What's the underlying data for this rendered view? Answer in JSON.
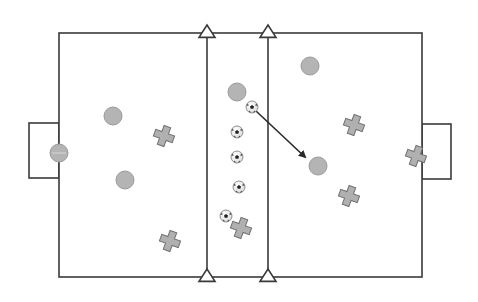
{
  "diagram": {
    "type": "soccer-drill",
    "colors": {
      "line": "#3a3a3a",
      "player_fill": "#b4b4b4",
      "player_stroke": "#9a9a9a",
      "cross_fill": "#b0b0b0",
      "cross_stroke": "#6e6e6e",
      "cone_fill": "#ffffff",
      "arrow": "#2a2a2a"
    },
    "field": {
      "x": 59,
      "y": 33,
      "w": 363,
      "h": 244
    },
    "middle_zone": {
      "x1": 207,
      "x2": 268
    },
    "goals": [
      {
        "side": "left",
        "x": 29,
        "y": 123,
        "w": 30,
        "h": 55
      },
      {
        "side": "right",
        "x": 422,
        "y": 124,
        "w": 29,
        "h": 55
      }
    ],
    "cones": [
      {
        "x": 207,
        "y": 33
      },
      {
        "x": 268,
        "y": 33
      },
      {
        "x": 207,
        "y": 277
      },
      {
        "x": 268,
        "y": 277
      }
    ],
    "players_circle": [
      {
        "x": 113,
        "y": 116,
        "r": 9
      },
      {
        "x": 125,
        "y": 180,
        "r": 9
      },
      {
        "x": 237,
        "y": 92,
        "r": 9
      },
      {
        "x": 310,
        "y": 66,
        "r": 9
      },
      {
        "x": 318,
        "y": 166,
        "r": 9
      },
      {
        "x": 59,
        "y": 153,
        "r": 9,
        "role": "goalkeeper"
      }
    ],
    "players_cross": [
      {
        "x": 164,
        "y": 136,
        "rot": 20
      },
      {
        "x": 170,
        "y": 241,
        "rot": 20
      },
      {
        "x": 241,
        "y": 228,
        "rot": 20
      },
      {
        "x": 354,
        "y": 125,
        "rot": 20
      },
      {
        "x": 349,
        "y": 196,
        "rot": 20
      },
      {
        "x": 416,
        "y": 156,
        "rot": 20
      }
    ],
    "balls": [
      {
        "x": 252,
        "y": 107
      },
      {
        "x": 237,
        "y": 132
      },
      {
        "x": 237,
        "y": 157
      },
      {
        "x": 239,
        "y": 187
      },
      {
        "x": 226,
        "y": 216
      }
    ],
    "arrows": [
      {
        "x1": 256,
        "y1": 111,
        "x2": 305,
        "y2": 157
      }
    ]
  }
}
